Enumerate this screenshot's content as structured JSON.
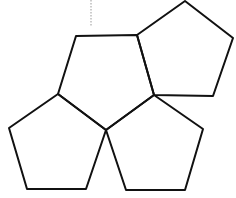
{
  "diagram": {
    "stroke_color": "#111111",
    "background": "#ffffff",
    "guide_line": {
      "x1": 91,
      "y1": 0,
      "x2": 91,
      "y2": 26,
      "color": "#999999",
      "style": "dotted"
    },
    "pentagons": [
      {
        "id": "top-center",
        "points": "76,36 137,35 154,95 106,130 58,94"
      },
      {
        "id": "top-right",
        "points": "185,1 233,38 213,96 154,95 137,35"
      },
      {
        "id": "bottom-left",
        "points": "58,94 106,130 86,189 27,189 9,128"
      },
      {
        "id": "bottom-right",
        "points": "154,95 203,129 185,190 126,190 106,130"
      }
    ]
  }
}
